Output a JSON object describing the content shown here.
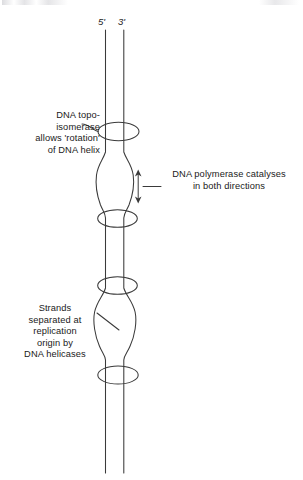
{
  "figure": {
    "background_color": "#ffffff",
    "stroke_color": "#3a3a3a",
    "text_color": "#1a1a1a"
  },
  "strand_labels": {
    "five_prime": "5'",
    "three_prime": "3'"
  },
  "annotations": {
    "topoisomerase": {
      "text": "DNA topo-\nisomerase\nallows 'rotation'\nof DNA helix",
      "lines": [
        "DNA topo-",
        "isomerase",
        "allows 'rotation'",
        "of DNA helix"
      ]
    },
    "polymerase": {
      "text": "DNA polymerase catalyses\nin both directions",
      "lines": [
        "DNA polymerase catalyses",
        "in both directions"
      ]
    },
    "helicase": {
      "text": "Strands\nseparated at\nreplication\norigin by\nDNA helicases",
      "lines": [
        "Strands",
        "separated at",
        "replication",
        "origin by",
        "DNA helicases"
      ]
    }
  },
  "diagram_elements": {
    "strands": [
      {
        "name": "five-prime-strand",
        "x": 105
      },
      {
        "name": "three-prime-strand",
        "x": 124
      }
    ],
    "enzyme_rings": [
      {
        "name": "topoisomerase-ring-1",
        "cy": 131
      },
      {
        "name": "enzyme-ring-2",
        "cy": 218
      },
      {
        "name": "enzyme-ring-3",
        "cy": 285
      },
      {
        "name": "enzyme-ring-4",
        "cy": 375
      }
    ],
    "replication_bubbles": [
      {
        "name": "replication-bubble-upper",
        "top": 155,
        "bottom": 216
      },
      {
        "name": "replication-bubble-lower",
        "top": 293,
        "bottom": 360
      }
    ],
    "bidirectional_arrow": {
      "name": "bidirectional-arrow",
      "x": 138,
      "top": 170,
      "bottom": 203
    }
  }
}
